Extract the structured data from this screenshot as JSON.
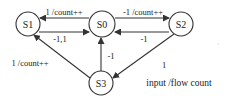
{
  "diagram": {
    "type": "state-machine",
    "colors": {
      "stroke": "#333333",
      "text": "#222222",
      "background": "#ffffff"
    },
    "nodes": [
      {
        "id": "S0",
        "label": "S0"
      },
      {
        "id": "S1",
        "label": "S1"
      },
      {
        "id": "S2",
        "label": "S2"
      },
      {
        "id": "S3",
        "label": "S3"
      }
    ],
    "edges": [
      {
        "from": "S0",
        "to": "S1",
        "label": "1 /count++"
      },
      {
        "from": "S1",
        "to": "S0",
        "label": "-1,1"
      },
      {
        "from": "S0",
        "to": "S2",
        "label": "-1 /count++"
      },
      {
        "from": "S2",
        "to": "S0",
        "label": "-1"
      },
      {
        "from": "S3",
        "to": "S1",
        "label": "1 /count++"
      },
      {
        "from": "S3",
        "to": "S0",
        "label": "-1"
      },
      {
        "from": "S2",
        "to": "S3",
        "label": "1"
      }
    ],
    "caption": "input /flow count"
  }
}
